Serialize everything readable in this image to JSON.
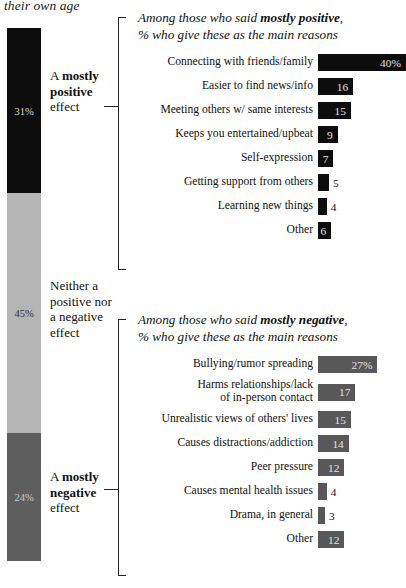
{
  "headline_fragment": "their own age",
  "stacked_bar": {
    "segments": [
      {
        "label_html": "A mostly positive effect",
        "label_plain": "A mostly positive effect",
        "bold_word": "mostly",
        "value": 31,
        "value_label": "31%",
        "color": "#0d0d0d"
      },
      {
        "label_plain": "Neither a positive nor a negative effect",
        "value": 45,
        "value_label": "45%",
        "color": "#b5b5b5"
      },
      {
        "label_plain": "A mostly negative effect",
        "bold_word": "mostly",
        "value": 24,
        "value_label": "24%",
        "color": "#5e5e5e"
      }
    ],
    "labels": {
      "positive_line1": "A ",
      "positive_bold": "mostly",
      "positive_line2": "positive",
      "positive_line3": "effect",
      "neutral_line1": "Neither a",
      "neutral_line2": "positive nor",
      "neutral_line3": "a negative",
      "neutral_line4": "effect",
      "negative_line1": "A ",
      "negative_bold": "mostly",
      "negative_line2": "negative",
      "negative_line3": "effect"
    }
  },
  "chart_data": [
    {
      "type": "bar",
      "title": "Among those who said mostly positive, % who give these as the main reasons",
      "title_part1": "Among those who said ",
      "title_emphasis": "mostly positive",
      "title_part2": ",",
      "title_line2": "% who give these as the main reasons",
      "xlabel": "",
      "ylabel": "",
      "xlim": [
        0,
        45
      ],
      "grid": false,
      "legend": "none",
      "bar_color": "#0d0d0d",
      "categories": [
        "Connecting with friends/family",
        "Easier to find news/info",
        "Meeting others w/ same interests",
        "Keeps you entertained/upbeat",
        "Self-expression",
        "Getting support from others",
        "Learning new things",
        "Other"
      ],
      "values": [
        40,
        16,
        15,
        9,
        7,
        5,
        4,
        6
      ],
      "value_labels": [
        "40%",
        "16",
        "15",
        "9",
        "7",
        "5",
        "4",
        "6"
      ],
      "label_inside": [
        true,
        true,
        true,
        true,
        true,
        false,
        false,
        true
      ]
    },
    {
      "type": "bar",
      "title": "Among those who said mostly negative, % who give these as the main reasons",
      "title_part1": "Among those who said ",
      "title_emphasis": "mostly negative",
      "title_part2": ",",
      "title_line2": "% who give these as the main reasons",
      "xlabel": "",
      "ylabel": "",
      "xlim": [
        0,
        45
      ],
      "grid": false,
      "legend": "none",
      "bar_color": "#585858",
      "categories": [
        "Bullying/rumor spreading",
        "Harms relationships/lack\nof in-person contact",
        "Unrealistic views of others' lives",
        "Causes distractions/addiction",
        "Peer pressure",
        "Causes mental health issues",
        "Drama, in general",
        "Other"
      ],
      "values": [
        27,
        17,
        15,
        14,
        12,
        4,
        3,
        12
      ],
      "value_labels": [
        "27%",
        "17",
        "15",
        "14",
        "12",
        "4",
        "3",
        "12"
      ],
      "label_inside": [
        true,
        true,
        true,
        true,
        true,
        false,
        false,
        true
      ]
    }
  ]
}
